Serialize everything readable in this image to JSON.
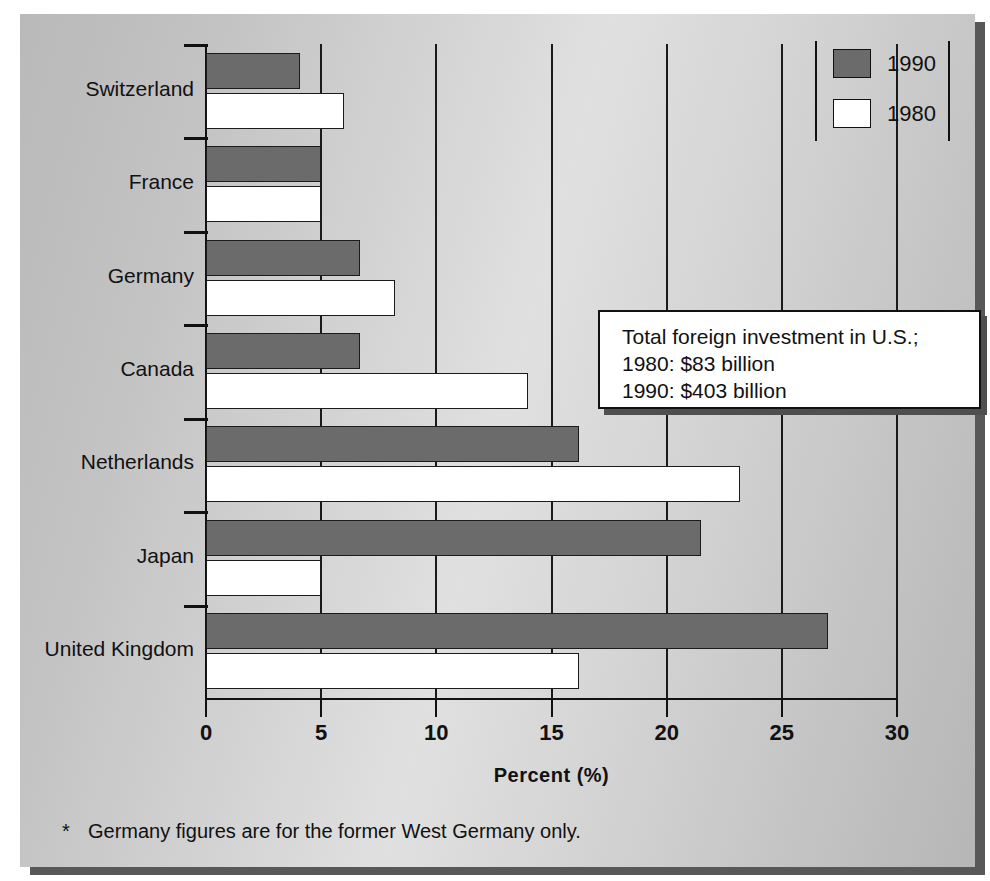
{
  "chart_data": {
    "type": "bar",
    "orientation": "horizontal",
    "title": "",
    "xlabel": "Percent (%)",
    "ylabel": "",
    "xlim": [
      0,
      30
    ],
    "xticks": [
      0,
      5,
      10,
      15,
      20,
      25,
      30
    ],
    "grid": "vertical",
    "legend_position": "top-right",
    "categories": [
      "Switzerland",
      "France",
      "Germany",
      "Canada",
      "Netherlands",
      "Japan",
      "United Kingdom"
    ],
    "series": [
      {
        "name": "1990",
        "color": "#6b6b6b",
        "values": [
          4.1,
          5.0,
          6.7,
          6.7,
          16.2,
          21.5,
          27.0
        ]
      },
      {
        "name": "1980",
        "color": "#ffffff",
        "values": [
          6.0,
          5.0,
          8.2,
          14.0,
          23.2,
          5.0,
          16.2
        ]
      }
    ],
    "annotations": [
      "Total foreign investment in U.S.;",
      "1980: $83 billion",
      "1990: $403 billion"
    ],
    "footnote": "Germany figures are for the former West Germany only.",
    "footnote_marker": "*"
  },
  "legend": {
    "items": [
      {
        "label": "1990",
        "color": "#6b6b6b"
      },
      {
        "label": "1980",
        "color": "#ffffff"
      }
    ]
  },
  "axis": {
    "x_title": "Percent (%)",
    "ticks": [
      "0",
      "5",
      "10",
      "15",
      "20",
      "25",
      "30"
    ]
  },
  "callout": {
    "line1": "Total foreign investment in U.S.;",
    "line2": "1980: $83 billion",
    "line3": "1990: $403 billion"
  },
  "footnote": {
    "marker": "*",
    "text": "Germany figures are for the former West Germany only."
  }
}
